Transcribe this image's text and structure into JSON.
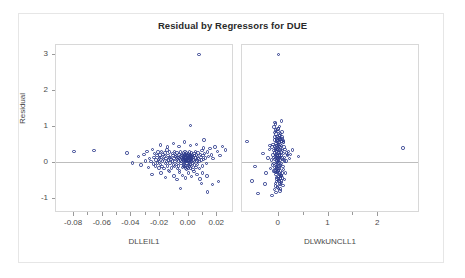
{
  "chart": {
    "title": "Residual by Regressors for DUE",
    "y_axis_label": "Residual"
  },
  "chart_data": {
    "type": "scatter",
    "title": "Residual by Regressors for DUE",
    "ylabel": "Residual",
    "grid": false,
    "legend": false,
    "reference_line_y": 0,
    "panels": [
      {
        "xlabel": "DLLEIL1",
        "xticks": [
          -0.08,
          -0.06,
          -0.04,
          -0.02,
          0.0,
          0.02
        ],
        "xticklabels": [
          "-0.08",
          "-0.06",
          "-0.04",
          "-0.02",
          "0.00",
          "0.02"
        ],
        "xlim": [
          -0.092,
          0.031
        ],
        "yticks": [
          -1,
          0,
          1,
          2,
          3
        ],
        "yticklabels": [
          "-1",
          "0",
          "1",
          "2",
          "3"
        ],
        "ylim": [
          -1.35,
          3.25
        ],
        "x": [
          -0.0795,
          -0.0655,
          -0.0425,
          -0.0385,
          -0.0345,
          -0.0325,
          -0.0305,
          -0.0295,
          -0.0285,
          -0.0275,
          -0.0265,
          -0.0255,
          -0.0245,
          -0.024,
          -0.0235,
          -0.023,
          -0.0225,
          -0.022,
          -0.0215,
          -0.0212,
          -0.0208,
          -0.0205,
          -0.02,
          -0.0198,
          -0.0195,
          -0.0192,
          -0.0188,
          -0.0185,
          -0.0182,
          -0.0178,
          -0.0175,
          -0.0172,
          -0.0168,
          -0.0165,
          -0.0162,
          -0.0158,
          -0.0155,
          -0.0152,
          -0.0148,
          -0.0145,
          -0.0142,
          -0.0138,
          -0.0135,
          -0.0132,
          -0.0128,
          -0.0125,
          -0.0122,
          -0.0118,
          -0.0115,
          -0.0112,
          -0.0108,
          -0.0105,
          -0.0102,
          -0.0098,
          -0.0095,
          -0.0092,
          -0.009,
          -0.0088,
          -0.0085,
          -0.0083,
          -0.008,
          -0.0078,
          -0.0075,
          -0.0073,
          -0.007,
          -0.0068,
          -0.0065,
          -0.0063,
          -0.006,
          -0.0058,
          -0.0055,
          -0.0053,
          -0.005,
          -0.0048,
          -0.0046,
          -0.0044,
          -0.0042,
          -0.004,
          -0.0038,
          -0.0036,
          -0.0034,
          -0.0032,
          -0.003,
          -0.0029,
          -0.0028,
          -0.0027,
          -0.0026,
          -0.0025,
          -0.0024,
          -0.0023,
          -0.0022,
          -0.0021,
          -0.002,
          -0.0019,
          -0.0018,
          -0.0017,
          -0.0016,
          -0.0015,
          -0.0014,
          -0.0013,
          -0.0012,
          -0.0011,
          -0.001,
          -0.0009,
          -0.0008,
          -0.0007,
          -0.0006,
          -0.0005,
          -0.0004,
          -0.0003,
          -0.0002,
          -0.0001,
          0.0,
          0.0001,
          0.0002,
          0.0003,
          0.0004,
          0.0005,
          0.0006,
          0.0007,
          0.0008,
          0.0009,
          0.001,
          0.0011,
          0.0012,
          0.0013,
          0.0014,
          0.0015,
          0.0016,
          0.0017,
          0.0018,
          0.0019,
          0.002,
          0.0021,
          0.0022,
          0.0023,
          0.0024,
          0.0025,
          0.0026,
          0.0027,
          0.0028,
          0.003,
          0.0032,
          0.0034,
          0.0036,
          0.0038,
          0.004,
          0.0042,
          0.0044,
          0.0046,
          0.0048,
          0.005,
          0.0053,
          0.0055,
          0.0058,
          0.006,
          0.0063,
          0.0065,
          0.0068,
          0.007,
          0.0073,
          0.0076,
          0.008,
          0.0084,
          0.0088,
          0.0092,
          0.0096,
          0.01,
          0.0104,
          0.0108,
          0.0112,
          0.0118,
          0.0124,
          0.013,
          0.0138,
          0.0146,
          0.0155,
          0.0165,
          0.0178,
          0.0192,
          0.0208,
          0.0225,
          0.0245,
          0.0265,
          -0.025,
          -0.0185,
          -0.0155,
          -0.0125,
          -0.0095,
          -0.0075,
          -0.0055,
          -0.0035,
          -0.0015,
          0.0005,
          0.0025,
          0.0045,
          0.0065,
          0.0085,
          0.0105,
          0.0135,
          -0.019,
          -0.014,
          -0.01,
          -0.006,
          -0.002,
          0.002,
          0.006,
          0.011,
          0.0095,
          0.014,
          0.0175,
          0.0215,
          0.0078,
          0.0115,
          -0.005,
          0.002
        ],
        "y": [
          0.3,
          0.33,
          0.26,
          -0.02,
          0.16,
          -0.08,
          0.22,
          0.04,
          0.3,
          -0.14,
          0.1,
          0.02,
          0.36,
          -0.05,
          0.14,
          0.24,
          -0.1,
          0.06,
          0.18,
          -0.02,
          0.28,
          0.08,
          -0.16,
          0.12,
          0.02,
          0.2,
          -0.06,
          0.14,
          0.3,
          -0.12,
          0.04,
          0.22,
          0.08,
          -0.18,
          0.16,
          0.26,
          -0.04,
          0.1,
          0.02,
          0.34,
          -0.1,
          0.18,
          0.06,
          -0.22,
          0.12,
          0.28,
          -0.02,
          0.14,
          0.08,
          -0.16,
          0.24,
          0.04,
          0.18,
          -0.08,
          0.1,
          0.3,
          -0.12,
          0.02,
          0.16,
          0.22,
          -0.06,
          0.12,
          0.26,
          -0.18,
          0.08,
          0.14,
          0.04,
          -0.1,
          0.2,
          0.1,
          -0.22,
          0.16,
          0.06,
          0.28,
          -0.04,
          0.12,
          0.02,
          0.18,
          -0.14,
          0.08,
          0.22,
          0.1,
          -0.08,
          0.14,
          0.04,
          0.26,
          -0.12,
          0.16,
          0.06,
          0.02,
          0.2,
          -0.06,
          0.1,
          0.3,
          0.12,
          -0.16,
          0.08,
          0.18,
          0.04,
          -0.1,
          0.22,
          0.14,
          0.02,
          -0.2,
          0.1,
          0.26,
          0.06,
          0.16,
          -0.04,
          0.12,
          0.2,
          -0.14,
          0.08,
          0.02,
          0.18,
          0.1,
          -0.08,
          0.24,
          0.14,
          0.04,
          -0.18,
          0.12,
          0.06,
          0.2,
          0.02,
          -0.1,
          0.16,
          0.28,
          0.08,
          -0.06,
          0.14,
          0.1,
          0.22,
          -0.16,
          0.04,
          0.18,
          0.12,
          0.02,
          -0.12,
          0.26,
          0.08,
          0.16,
          -0.04,
          0.2,
          0.1,
          -0.2,
          0.14,
          0.06,
          0.24,
          0.02,
          -0.08,
          0.18,
          0.12,
          0.3,
          -0.14,
          0.08,
          0.2,
          0.04,
          0.16,
          -0.06,
          0.26,
          0.1,
          0.02,
          -0.18,
          0.22,
          0.14,
          0.06,
          0.32,
          -0.1,
          0.18,
          0.08,
          0.24,
          0.12,
          -0.04,
          0.28,
          0.16,
          0.38,
          0.2,
          0.1,
          0.42,
          0.3,
          0.18,
          0.44,
          0.34,
          -0.34,
          -0.3,
          -0.42,
          -0.26,
          -0.38,
          -0.48,
          -0.28,
          -0.36,
          -0.44,
          -0.3,
          -0.4,
          -0.26,
          -0.34,
          -0.46,
          -0.3,
          -0.38,
          0.48,
          0.42,
          0.52,
          0.44,
          0.56,
          0.46,
          0.5,
          0.4,
          -0.58,
          -0.82,
          -0.62,
          -0.54,
          2.98,
          0.62,
          -0.72,
          1.02
        ],
        "annotations": [
          {
            "note": "single extreme positive residual near y=3 at x~0.008"
          },
          {
            "note": "dense cluster of residuals centered at x~0, y~0"
          }
        ]
      },
      {
        "xlabel": "DLWkUNCLL1",
        "xticks": [
          0,
          1,
          2
        ],
        "xticklabels": [
          "0",
          "1",
          "2"
        ],
        "xlim": [
          -0.72,
          2.82
        ],
        "yticks": [
          -1,
          0,
          1,
          2,
          3
        ],
        "yticklabels": [
          "-1",
          "0",
          "1",
          "2",
          "3"
        ],
        "ylim": [
          -1.35,
          3.25
        ],
        "x": [
          -0.62,
          -0.46,
          -0.3,
          -0.24,
          -0.2,
          -0.17,
          -0.15,
          -0.13,
          -0.12,
          -0.11,
          -0.1,
          -0.095,
          -0.09,
          -0.085,
          -0.08,
          -0.075,
          -0.07,
          -0.066,
          -0.062,
          -0.058,
          -0.055,
          -0.052,
          -0.049,
          -0.046,
          -0.043,
          -0.04,
          -0.038,
          -0.036,
          -0.034,
          -0.032,
          -0.03,
          -0.028,
          -0.026,
          -0.024,
          -0.022,
          -0.02,
          -0.018,
          -0.016,
          -0.014,
          -0.012,
          -0.01,
          -0.008,
          -0.006,
          -0.004,
          -0.002,
          0.0,
          0.002,
          0.004,
          0.006,
          0.008,
          0.01,
          0.012,
          0.014,
          0.016,
          0.018,
          0.02,
          0.022,
          0.024,
          0.026,
          0.028,
          0.03,
          0.033,
          0.036,
          0.039,
          0.042,
          0.045,
          0.048,
          0.052,
          0.056,
          0.06,
          0.064,
          0.068,
          0.072,
          0.078,
          0.084,
          0.09,
          0.098,
          0.106,
          0.115,
          0.125,
          0.135,
          0.148,
          0.162,
          0.178,
          0.196,
          0.215,
          0.235,
          0.255,
          -0.035,
          -0.02,
          -0.005,
          0.01,
          0.025,
          0.04,
          0.055,
          0.07,
          -0.05,
          -0.03,
          -0.01,
          0.012,
          0.032,
          0.052,
          0.072,
          0.092,
          -0.058,
          -0.038,
          -0.018,
          0.002,
          0.022,
          0.042,
          0.062,
          0.082,
          -0.045,
          -0.025,
          -0.005,
          0.015,
          0.035,
          0.055,
          0.078,
          0.1,
          -0.068,
          -0.042,
          -0.016,
          0.008,
          0.034,
          0.06,
          0.086,
          0.112,
          -0.055,
          -0.028,
          0.0,
          0.028,
          0.056,
          0.084,
          0.11,
          0.14,
          -0.075,
          -0.048,
          -0.022,
          0.004,
          0.03,
          0.058,
          0.088,
          0.12,
          -0.062,
          -0.034,
          -0.008,
          0.018,
          0.046,
          0.074,
          0.104,
          0.134,
          -0.52,
          -0.4,
          -0.26,
          0.3,
          0.42,
          2.52,
          0.015,
          -0.06,
          -0.12,
          0.08,
          0.16,
          -0.16,
          0.2,
          0.05,
          -0.02,
          0.11
        ],
        "y": [
          0.58,
          -0.12,
          0.24,
          -0.3,
          0.12,
          0.36,
          -0.18,
          0.06,
          0.42,
          -0.08,
          0.2,
          0.5,
          -0.24,
          0.14,
          0.32,
          -0.04,
          0.26,
          0.62,
          -0.14,
          0.08,
          0.44,
          0.18,
          -0.28,
          0.34,
          0.1,
          0.52,
          -0.06,
          0.22,
          0.4,
          -0.2,
          0.14,
          0.58,
          0.04,
          0.3,
          -0.12,
          0.46,
          0.18,
          0.66,
          -0.26,
          0.1,
          0.36,
          0.02,
          0.54,
          -0.08,
          0.24,
          0.42,
          0.14,
          -0.18,
          0.6,
          0.06,
          0.32,
          0.48,
          -0.22,
          0.16,
          0.38,
          0.02,
          0.56,
          -0.1,
          0.26,
          0.44,
          0.12,
          0.64,
          -0.16,
          0.2,
          0.34,
          0.06,
          0.5,
          -0.24,
          0.4,
          0.14,
          0.28,
          -0.04,
          0.46,
          0.18,
          0.58,
          0.08,
          0.32,
          -0.12,
          0.24,
          0.42,
          0.14,
          0.36,
          0.04,
          0.26,
          0.18,
          0.3,
          0.1,
          0.22,
          -0.34,
          -0.46,
          -0.28,
          -0.4,
          -0.52,
          -0.3,
          -0.44,
          -0.36,
          -0.58,
          -0.42,
          -0.26,
          -0.5,
          -0.34,
          -0.62,
          -0.38,
          -0.3,
          0.7,
          0.78,
          0.62,
          0.86,
          0.68,
          0.74,
          0.58,
          0.66,
          -0.66,
          -0.54,
          -0.7,
          -0.46,
          -0.6,
          -0.38,
          -0.52,
          -0.44,
          0.82,
          0.9,
          0.72,
          0.94,
          0.76,
          0.64,
          0.84,
          0.56,
          -0.24,
          -0.16,
          0.0,
          0.2,
          -0.08,
          0.12,
          -0.2,
          0.04,
          0.98,
          1.06,
          0.88,
          0.92,
          1.0,
          0.8,
          0.7,
          0.6,
          -0.76,
          -0.84,
          -0.68,
          -0.72,
          -0.8,
          -0.56,
          -0.64,
          -0.48,
          -0.52,
          -0.86,
          -0.6,
          0.34,
          0.16,
          0.4,
          2.98,
          1.1,
          -0.92,
          1.14,
          -0.3,
          0.46,
          0.22,
          -0.74,
          0.36,
          0.54
        ],
        "annotations": [
          {
            "note": "vertically elongated dense cluster at x~0"
          },
          {
            "note": "single extreme positive residual near y=3"
          },
          {
            "note": "isolated point near x=2.5, y=0.4"
          }
        ]
      }
    ]
  }
}
